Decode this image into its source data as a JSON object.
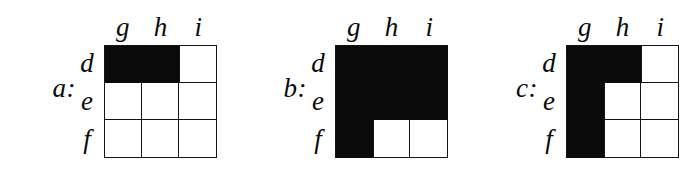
{
  "figure": {
    "type": "grid-diagram",
    "background_color": "#ffffff",
    "fill_color": "#0a0a0a",
    "line_color": "#141414",
    "grid_size": 3
  },
  "boards": [
    {
      "label": "a:",
      "column_headers": [
        "g",
        "h",
        "i"
      ],
      "row_headers": [
        "d",
        "e",
        "f"
      ],
      "cells": [
        [
          "filled",
          "filled",
          "empty"
        ],
        [
          "empty",
          "empty",
          "empty"
        ],
        [
          "empty",
          "empty",
          "empty"
        ]
      ]
    },
    {
      "label": "b:",
      "column_headers": [
        "g",
        "h",
        "i"
      ],
      "row_headers": [
        "d",
        "e",
        "f"
      ],
      "cells": [
        [
          "filled",
          "filled",
          "filled"
        ],
        [
          "filled",
          "filled",
          "filled"
        ],
        [
          "filled",
          "empty",
          "empty"
        ]
      ]
    },
    {
      "label": "c:",
      "column_headers": [
        "g",
        "h",
        "i"
      ],
      "row_headers": [
        "d",
        "e",
        "f"
      ],
      "cells": [
        [
          "filled",
          "filled",
          "empty"
        ],
        [
          "filled",
          "empty",
          "empty"
        ],
        [
          "filled",
          "empty",
          "empty"
        ]
      ]
    }
  ]
}
